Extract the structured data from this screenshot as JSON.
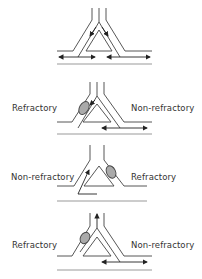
{
  "figure": {
    "panels": [
      {
        "id": 1,
        "left_label": "",
        "right_label": "",
        "description": "Bidirectional conduction through both limbs of the ring"
      },
      {
        "id": 2,
        "left_label": "Refractory",
        "right_label": "Non-refractory",
        "description": "Impulse blocked in refractory left limb; conducts down right limb"
      },
      {
        "id": 3,
        "left_label": "Non-refractory",
        "right_label": "Refractory",
        "description": "Impulse re-enters retrogradely up left limb"
      },
      {
        "id": 4,
        "left_label": "Refractory",
        "right_label": "Non-refractory",
        "description": "Re-entrant impulse exits up the stem"
      }
    ],
    "colors": {
      "line": "#333333",
      "block": "#999999",
      "background": "#ffffff"
    }
  }
}
